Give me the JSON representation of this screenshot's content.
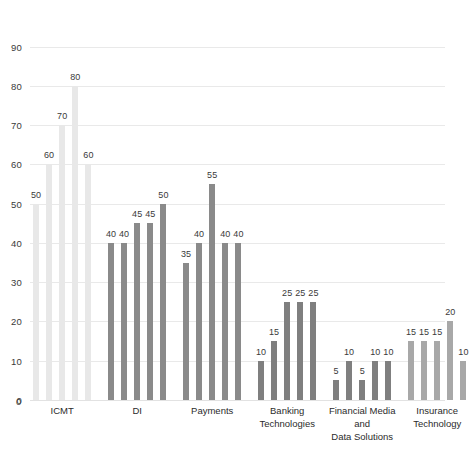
{
  "chart_data": {
    "type": "bar",
    "title": "",
    "subtitle": "",
    "xlabel": "",
    "ylabel": "",
    "ylim": [
      0,
      90
    ],
    "yticks": [
      0,
      10,
      20,
      30,
      40,
      50,
      60,
      70,
      80,
      90
    ],
    "grid": true,
    "legend": "none",
    "orientation": "vertical",
    "bar_labels_shown": true,
    "categories": [
      "ICMT",
      "DI",
      "Payments",
      "Banking\nTechnologies",
      "Financial Media and\nData Solutions",
      "Insurance\nTechnology"
    ],
    "groups": [
      {
        "name": "ICMT",
        "color": "#e8e8e8",
        "values": [
          50,
          60,
          70,
          80,
          60
        ]
      },
      {
        "name": "DI",
        "color": "#8a8a8a",
        "values": [
          40,
          40,
          45,
          45,
          50
        ]
      },
      {
        "name": "Payments",
        "color": "#8a8a8a",
        "values": [
          35,
          40,
          55,
          40,
          40
        ]
      },
      {
        "name": "Banking Technologies",
        "color": "#7f7f7f",
        "values": [
          10,
          15,
          25,
          25,
          25
        ]
      },
      {
        "name": "Financial Media and Data Solutions",
        "color": "#7f7f7f",
        "values": [
          5,
          10,
          5,
          10,
          10
        ]
      },
      {
        "name": "Insurance Technology",
        "color": "#a8a8a8",
        "values": [
          15,
          15,
          15,
          20,
          10
        ]
      }
    ],
    "values_flat": [
      50,
      60,
      70,
      80,
      60,
      40,
      40,
      45,
      45,
      50,
      35,
      40,
      55,
      40,
      40,
      10,
      15,
      25,
      25,
      25,
      5,
      10,
      5,
      10,
      10,
      15,
      15,
      15,
      20,
      10
    ]
  },
  "axis": {
    "y_tick_labels": [
      "0",
      "10",
      "20",
      "30",
      "40",
      "50",
      "60",
      "70",
      "80",
      "90"
    ],
    "zero_label": "0"
  },
  "colors": {
    "grid": "#e9e9e9",
    "text": "#3a3a3a",
    "bar_light": "#e8e8e8",
    "bar_mid": "#a8a8a8",
    "bar_dark": "#7f7f7f",
    "background": "#ffffff"
  }
}
